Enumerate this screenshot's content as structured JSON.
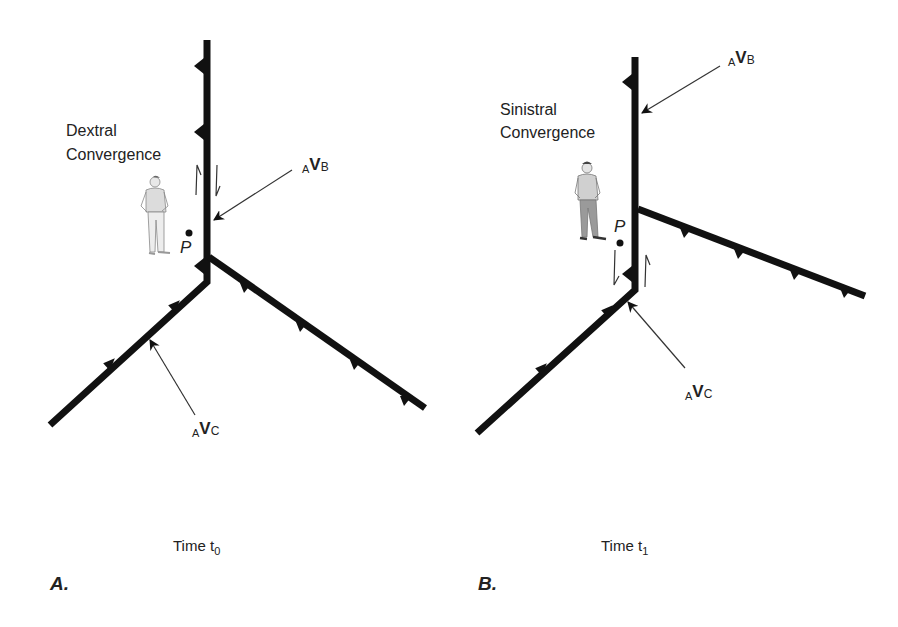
{
  "panels": [
    {
      "id": "A",
      "panel_label": "A.",
      "title_line1": "Dextral",
      "title_line2": "Convergence",
      "point_label": "P",
      "vb_prefix": "A",
      "vb_main": "V",
      "vb_sub": "B",
      "vc_prefix": "A",
      "vc_main": "V",
      "vc_sub": "C",
      "time_label": "Time t",
      "time_sub": "0",
      "shear_sense": "dextral"
    },
    {
      "id": "B",
      "panel_label": "B.",
      "title_line1": "Sinistral",
      "title_line2": "Convergence",
      "point_label": "P",
      "vb_prefix": "A",
      "vb_main": "V",
      "vb_sub": "B",
      "vc_prefix": "A",
      "vc_main": "V",
      "vc_sub": "C",
      "time_label": "Time t",
      "time_sub": "1",
      "shear_sense": "sinistral"
    }
  ],
  "colors": {
    "fault": "#111111",
    "text": "#222222",
    "arrow": "#333333",
    "figure_shirt": "#d8d8d8",
    "figure_pants": "#a0a0a0"
  }
}
